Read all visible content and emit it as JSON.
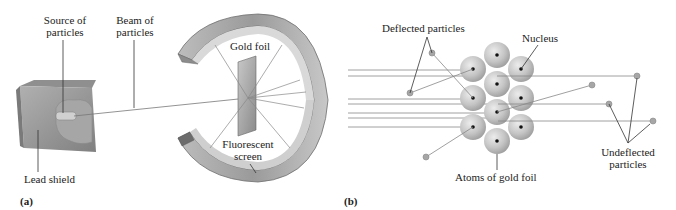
{
  "panel_a": {
    "panel_label": "(a)",
    "labels": {
      "source_line1": "Source of",
      "source_line2": "particles",
      "beam_line1": "Beam of",
      "beam_line2": "particles",
      "gold_foil": "Gold foil",
      "fluorescent_line1": "Fluorescent",
      "fluorescent_line2": "screen",
      "lead_shield": "Lead shield"
    }
  },
  "panel_b": {
    "panel_label": "(b)",
    "labels": {
      "deflected": "Deflected particles",
      "nucleus": "Nucleus",
      "undeflected_line1": "Undeflected",
      "undeflected_line2": "particles",
      "atoms": "Atoms of gold foil"
    }
  },
  "colors": {
    "line": "#888888",
    "leader": "#333333",
    "atom_fill": "#bdbdbd",
    "nucleus": "#111111",
    "ring_outer": "#a8a8a8",
    "ring_inner": "#d6d6d6",
    "lead_box": "#9a9a9a"
  }
}
